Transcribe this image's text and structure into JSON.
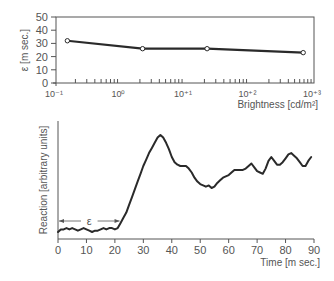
{
  "chart_data": [
    {
      "type": "line",
      "title": "",
      "xlabel": "Brightness [cd/m²]",
      "ylabel": "ε [m sec.]",
      "xscale": "log",
      "xlim": [
        0.1,
        1000
      ],
      "ylim": [
        0,
        50
      ],
      "x_tick_labels": [
        "10⁻¹",
        "10⁰",
        "10⁺¹",
        "10⁺²",
        "10⁺³"
      ],
      "x_ticks": [
        0.1,
        1,
        10,
        100,
        1000
      ],
      "y_ticks": [
        0,
        10,
        20,
        30,
        40,
        50
      ],
      "x": [
        0.15,
        2.2,
        22,
        680
      ],
      "values": [
        32,
        26,
        26,
        23
      ],
      "markers": "open-circle",
      "grid": false,
      "legend": null
    },
    {
      "type": "line",
      "title": "",
      "xlabel": "Time [m sec.]",
      "ylabel": "Reaction [arbitrary units]",
      "xlim": [
        0,
        90
      ],
      "ylim": [
        0,
        100
      ],
      "x_ticks": [
        0,
        10,
        20,
        30,
        40,
        50,
        60,
        70,
        80,
        90
      ],
      "y_ticks": [],
      "x": [
        0,
        1,
        2,
        3,
        4,
        5,
        6,
        7,
        8,
        9,
        10,
        11,
        12,
        13,
        14,
        15,
        16,
        17,
        18,
        19,
        20,
        21,
        22,
        23,
        24,
        25,
        26,
        27,
        28,
        29,
        30,
        31,
        32,
        33,
        34,
        35,
        36,
        37,
        38,
        39,
        40,
        41,
        42,
        43,
        44,
        45,
        46,
        47,
        48,
        49,
        50,
        51,
        52,
        53,
        54,
        55,
        56,
        57,
        58,
        59,
        60,
        61,
        62,
        63,
        64,
        65,
        66,
        67,
        68,
        69,
        70,
        71,
        72,
        73,
        74,
        75,
        76,
        77,
        78,
        79,
        80,
        81,
        82,
        83,
        84,
        85,
        86,
        87,
        88,
        89
      ],
      "values": [
        22,
        24,
        24,
        25,
        24,
        25,
        24,
        23,
        24,
        25,
        24,
        23,
        22,
        23,
        23,
        24,
        25,
        24,
        25,
        25,
        24,
        25,
        29,
        33,
        37,
        43,
        49,
        55,
        61,
        67,
        73,
        78,
        83,
        87,
        91,
        95,
        97,
        95,
        91,
        86,
        80,
        76,
        74,
        73,
        73,
        73,
        71,
        68,
        64,
        61,
        59,
        58,
        57,
        58,
        56,
        57,
        60,
        62,
        64,
        65,
        66,
        68,
        70,
        70,
        70,
        70,
        71,
        73,
        75,
        72,
        69,
        68,
        67,
        71,
        77,
        80,
        77,
        74,
        74,
        76,
        79,
        82,
        83,
        81,
        79,
        76,
        73,
        73,
        77,
        80
      ],
      "annotations": [
        {
          "text": "ε",
          "type": "double-arrow",
          "x_from": 0,
          "x_to": 22
        }
      ],
      "grid": false,
      "legend": null
    }
  ],
  "top_chart": {
    "ylabel": "ε [m sec.]",
    "xlabel": "Brightness [cd/m²]",
    "y_tick_labels": [
      "0",
      "10",
      "20",
      "30",
      "40",
      "50"
    ]
  },
  "bottom_chart": {
    "ylabel": "Reaction [arbitrary units]",
    "xlabel": "Time [m sec.]",
    "x_tick_labels": [
      "0",
      "10",
      "20",
      "30",
      "40",
      "50",
      "60",
      "70",
      "80",
      "90"
    ],
    "annotation": "ε"
  },
  "colors": {
    "line": "#2a2a2a",
    "axis": "#555555",
    "text": "#555555",
    "background": "#ffffff"
  }
}
